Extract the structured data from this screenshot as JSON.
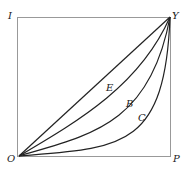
{
  "diagram": {
    "type": "lorenz-curves",
    "corner_labels": {
      "top_left": "I",
      "top_right": "Y",
      "bottom_left": "O",
      "bottom_right": "P"
    },
    "curve_labels": [
      "E",
      "B",
      "C"
    ],
    "colors": {
      "line": "#222222",
      "box": "#999999",
      "background": "#ffffff"
    }
  }
}
